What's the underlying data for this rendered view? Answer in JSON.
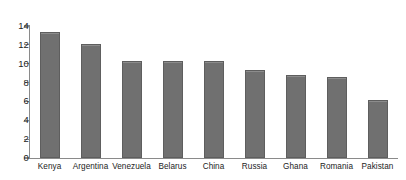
{
  "chart_data": {
    "type": "bar",
    "title": "",
    "subtitle": "",
    "xlabel": "",
    "ylabel": "",
    "categories": [
      "Kenya",
      "Argentina",
      "Venezuela",
      "Belarus",
      "China",
      "Russia",
      "Ghana",
      "Romania",
      "Pakistan"
    ],
    "values": [
      13.4,
      12.1,
      10.3,
      10.3,
      10.3,
      9.3,
      8.8,
      8.6,
      6.2
    ],
    "ylim": [
      0,
      14
    ],
    "yticks": [
      0,
      2,
      4,
      6,
      8,
      10,
      12,
      14
    ],
    "ytick_labels": [
      "0",
      "2",
      "4",
      "6",
      "8",
      "10",
      "12",
      "14"
    ],
    "grid": false,
    "legend": false,
    "legend_position": "none",
    "bar_color": "#707070",
    "bar_border_color": "#5e5e5e",
    "axis_color": "#8a8a8a",
    "background_color": "#ffffff",
    "text_color": "#1c1c1c"
  }
}
